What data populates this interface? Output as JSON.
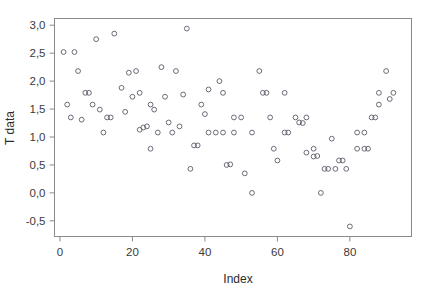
{
  "chart_data": {
    "type": "scatter",
    "title": "",
    "xlabel": "Index",
    "ylabel": "T data",
    "xlim": [
      -1.5,
      97
    ],
    "ylim": [
      -0.78,
      3.12
    ],
    "xticks": [
      0,
      20,
      40,
      60,
      80
    ],
    "xticklabels": [
      "0",
      "20",
      "40",
      "60",
      "80"
    ],
    "yticks": [
      -0.5,
      0.0,
      0.5,
      1.0,
      1.5,
      2.0,
      2.5,
      3.0
    ],
    "yticklabels": [
      "-0,5",
      "0,0",
      "0,5",
      "1,0",
      "1,5",
      "2,0",
      "2,5",
      "3,0"
    ],
    "grid": false,
    "legend": null,
    "decimal_separator": ",",
    "marker": "open-circle",
    "marker_color": "#5a5a6a",
    "frame_color": "#8a8a8a",
    "background": "#ffffff",
    "x": [
      1,
      2,
      4,
      5,
      6,
      7,
      8,
      9,
      10,
      11,
      12,
      13,
      14,
      15,
      16,
      17,
      18,
      19,
      20,
      21,
      22,
      23,
      24,
      25,
      26,
      27,
      28,
      29,
      30,
      31,
      32,
      33,
      34,
      35,
      36,
      37,
      38,
      40,
      41,
      42,
      43,
      44,
      45,
      46,
      47,
      48,
      49,
      50,
      51,
      52,
      53,
      54,
      55,
      56,
      57,
      58,
      59,
      60,
      61,
      62,
      63,
      64,
      65,
      66,
      67,
      68,
      69,
      70,
      71,
      72,
      73,
      74,
      75,
      76,
      77,
      78,
      79,
      80,
      81,
      82,
      83,
      84,
      85,
      86,
      87,
      88,
      89,
      90,
      91,
      92,
      93
    ],
    "y": [
      2.52,
      1.58,
      2.52,
      1.35,
      2.18,
      1.31,
      1.79,
      1.79,
      2.75,
      1.58,
      1.49,
      1.08,
      2.85,
      1.35,
      1.35,
      2.15,
      1.88,
      1.45,
      2.18,
      1.72,
      1.79,
      1.13,
      1.16,
      1.19,
      1.58,
      0.79,
      1.49,
      2.25,
      1.08,
      1.72,
      1.25,
      1.08,
      2.18,
      1.19,
      1.76,
      2.94,
      0.43,
      0.85,
      1.58,
      0.85,
      1.41,
      1.85,
      1.08,
      2.0,
      1.08,
      1.79,
      1.08,
      0.5,
      0.51,
      1.35,
      1.08,
      1.35,
      0.35,
      1.08,
      0.0,
      2.18,
      1.79,
      1.79,
      1.35,
      0.79,
      0.58,
      1.79,
      1.08,
      1.08,
      1.35,
      1.26,
      1.25,
      0.72,
      1.35,
      0.79,
      0.65,
      0.66,
      0.0,
      0.43,
      0.43,
      0.97,
      0.43,
      0.58,
      0.58,
      0.43,
      -0.6,
      1.08,
      0.79,
      1.08,
      0.79,
      0.79,
      1.35,
      1.35,
      1.79,
      1.58,
      2.18,
      1.68,
      1.79
    ],
    "points": [
      {
        "x": 1,
        "y": 2.52
      },
      {
        "x": 2,
        "y": 1.58
      },
      {
        "x": 4,
        "y": 2.52
      },
      {
        "x": 3,
        "y": 1.35
      },
      {
        "x": 5,
        "y": 2.18
      },
      {
        "x": 6,
        "y": 1.31
      },
      {
        "x": 7,
        "y": 1.79
      },
      {
        "x": 8,
        "y": 1.79
      },
      {
        "x": 10,
        "y": 2.75
      },
      {
        "x": 9,
        "y": 1.58
      },
      {
        "x": 11,
        "y": 1.49
      },
      {
        "x": 12,
        "y": 1.08
      },
      {
        "x": 15,
        "y": 2.85
      },
      {
        "x": 13,
        "y": 1.35
      },
      {
        "x": 14,
        "y": 1.35
      },
      {
        "x": 19,
        "y": 2.15
      },
      {
        "x": 17,
        "y": 1.88
      },
      {
        "x": 18,
        "y": 1.45
      },
      {
        "x": 21,
        "y": 2.18
      },
      {
        "x": 20,
        "y": 1.72
      },
      {
        "x": 22,
        "y": 1.79
      },
      {
        "x": 22,
        "y": 1.13
      },
      {
        "x": 23,
        "y": 1.17
      },
      {
        "x": 24,
        "y": 1.19
      },
      {
        "x": 25,
        "y": 1.58
      },
      {
        "x": 25,
        "y": 0.79
      },
      {
        "x": 26,
        "y": 1.49
      },
      {
        "x": 28,
        "y": 2.25
      },
      {
        "x": 27,
        "y": 1.08
      },
      {
        "x": 29,
        "y": 1.72
      },
      {
        "x": 30,
        "y": 1.26
      },
      {
        "x": 31,
        "y": 1.08
      },
      {
        "x": 32,
        "y": 2.18
      },
      {
        "x": 33,
        "y": 1.19
      },
      {
        "x": 34,
        "y": 1.76
      },
      {
        "x": 35,
        "y": 2.94
      },
      {
        "x": 36,
        "y": 0.43
      },
      {
        "x": 37,
        "y": 0.85
      },
      {
        "x": 39,
        "y": 1.58
      },
      {
        "x": 38,
        "y": 0.85
      },
      {
        "x": 40,
        "y": 1.41
      },
      {
        "x": 41,
        "y": 1.85
      },
      {
        "x": 41,
        "y": 1.08
      },
      {
        "x": 44,
        "y": 2.0
      },
      {
        "x": 43,
        "y": 1.08
      },
      {
        "x": 45,
        "y": 1.79
      },
      {
        "x": 45,
        "y": 1.08
      },
      {
        "x": 46,
        "y": 0.5
      },
      {
        "x": 47,
        "y": 0.51
      },
      {
        "x": 48,
        "y": 1.35
      },
      {
        "x": 48,
        "y": 1.08
      },
      {
        "x": 50,
        "y": 1.35
      },
      {
        "x": 51,
        "y": 0.35
      },
      {
        "x": 53,
        "y": 1.08
      },
      {
        "x": 53,
        "y": 0.0
      },
      {
        "x": 55,
        "y": 2.18
      },
      {
        "x": 56,
        "y": 1.79
      },
      {
        "x": 57,
        "y": 1.79
      },
      {
        "x": 58,
        "y": 1.35
      },
      {
        "x": 59,
        "y": 0.79
      },
      {
        "x": 60,
        "y": 0.58
      },
      {
        "x": 62,
        "y": 1.79
      },
      {
        "x": 62,
        "y": 1.08
      },
      {
        "x": 63,
        "y": 1.08
      },
      {
        "x": 65,
        "y": 1.35
      },
      {
        "x": 66,
        "y": 1.26
      },
      {
        "x": 67,
        "y": 1.25
      },
      {
        "x": 68,
        "y": 0.72
      },
      {
        "x": 68,
        "y": 1.35
      },
      {
        "x": 70,
        "y": 0.79
      },
      {
        "x": 70,
        "y": 0.65
      },
      {
        "x": 71,
        "y": 0.66
      },
      {
        "x": 72,
        "y": 0.0
      },
      {
        "x": 73,
        "y": 0.43
      },
      {
        "x": 74,
        "y": 0.43
      },
      {
        "x": 75,
        "y": 0.97
      },
      {
        "x": 76,
        "y": 0.43
      },
      {
        "x": 77,
        "y": 0.58
      },
      {
        "x": 78,
        "y": 0.58
      },
      {
        "x": 79,
        "y": 0.43
      },
      {
        "x": 80,
        "y": -0.6
      },
      {
        "x": 82,
        "y": 1.08
      },
      {
        "x": 82,
        "y": 0.79
      },
      {
        "x": 84,
        "y": 1.08
      },
      {
        "x": 84,
        "y": 0.79
      },
      {
        "x": 85,
        "y": 0.79
      },
      {
        "x": 86,
        "y": 1.35
      },
      {
        "x": 87,
        "y": 1.35
      },
      {
        "x": 88,
        "y": 1.79
      },
      {
        "x": 88,
        "y": 1.58
      },
      {
        "x": 90,
        "y": 2.18
      },
      {
        "x": 91,
        "y": 1.68
      },
      {
        "x": 92,
        "y": 1.79
      }
    ]
  }
}
